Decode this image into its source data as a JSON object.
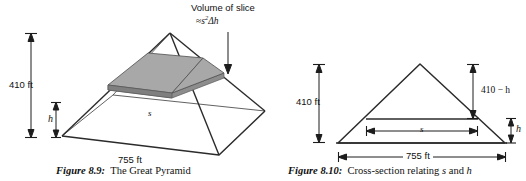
{
  "figure_left": {
    "caption_number": "Figure 8.9:",
    "caption_text": "The Great Pyramid",
    "annotation_line1": "Volume of slice",
    "annotation_line2_approx": "≈",
    "annotation_line2_var": "s",
    "annotation_line2_exp": "2",
    "annotation_line2_delta": "Δh",
    "height_label": "410 ft",
    "slice_thickness_label": "h",
    "side_label": "s",
    "base_label": "755 ft"
  },
  "figure_right": {
    "caption_number": "Figure 8.10:",
    "caption_text": "Cross-section relating",
    "caption_var1": "s",
    "caption_and": "and",
    "caption_var2": "h",
    "height_label": "410 ft",
    "upper_height_label": "410 − h",
    "slice_width_label": "s",
    "slice_thickness_label": "h",
    "base_label": "755 ft"
  },
  "colors": {
    "line": "#2b2b2b",
    "slice_top_fill": "#a9a9a9",
    "slice_side_fill": "#8f8f8f",
    "slice_edge": "#5a5a5a",
    "background": "#ffffff",
    "text": "#101010"
  },
  "geometry_note": {
    "type": "diagram",
    "pyramid_apex": [
      170,
      33
    ],
    "pyramid_base_left": [
      62,
      136
    ],
    "pyramid_base_front": [
      219,
      155
    ],
    "pyramid_base_right": [
      265,
      111
    ],
    "pyramid_base_back": [
      113,
      95
    ],
    "triangle_apex": [
      420,
      64
    ],
    "triangle_base_left": [
      338,
      143
    ],
    "triangle_base_right": [
      505,
      143
    ]
  }
}
